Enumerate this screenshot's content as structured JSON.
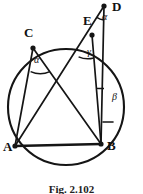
{
  "figure": {
    "caption": "Fig. 2.102",
    "background_color": "#ffffff",
    "stroke_color": "#151515",
    "vertices": [
      {
        "id": "A",
        "label": "A",
        "x": 15,
        "y": 146,
        "label_x": 3,
        "label_y": 142,
        "dot": true
      },
      {
        "id": "B",
        "label": "B",
        "x": 101,
        "y": 144,
        "label_x": 108,
        "label_y": 141,
        "dot": true
      },
      {
        "id": "C",
        "label": "C",
        "x": 33,
        "y": 48,
        "label_x": 25,
        "label_y": 27,
        "dot": true
      },
      {
        "id": "E",
        "label": "E",
        "x": 92,
        "y": 35,
        "label_x": 84,
        "label_y": 15,
        "dot": true
      },
      {
        "id": "D",
        "label": "D",
        "x": 104,
        "y": 6,
        "label_x": 112,
        "label_y": 1,
        "dot": true
      }
    ],
    "circle": {
      "cx": 66,
      "cy": 107,
      "r": 58
    },
    "segments": [
      {
        "name": "chord-AB",
        "from": "A",
        "to": "B"
      },
      {
        "name": "chord-CA",
        "from": "C",
        "to": "A"
      },
      {
        "name": "chord-CB",
        "from": "C",
        "to": "B"
      },
      {
        "name": "chord-EB",
        "from": "E",
        "to": "B"
      },
      {
        "name": "secant-AD",
        "from": "A",
        "to": "D"
      },
      {
        "name": "line-DB",
        "from": "D",
        "to": "B"
      }
    ],
    "angles": [
      {
        "id": "alpha-at-C",
        "symbol": "α",
        "label_x": 34,
        "label_y": 55,
        "vertex": "C"
      },
      {
        "id": "alpha-at-D",
        "symbol": "α",
        "label_x": 102,
        "label_y": 12,
        "vertex": "D"
      },
      {
        "id": "gamma-at-E",
        "symbol": "γ",
        "label_x": 87,
        "label_y": 48,
        "vertex": "E"
      },
      {
        "id": "beta-at-B",
        "symbol": "β",
        "label_x": 112,
        "label_y": 93,
        "vertex": "B"
      }
    ],
    "tick_marks": [
      {
        "name": "right-angle-tick-on-DB",
        "x1": 103,
        "y1": 122,
        "x2": 113,
        "y2": 122
      }
    ]
  }
}
